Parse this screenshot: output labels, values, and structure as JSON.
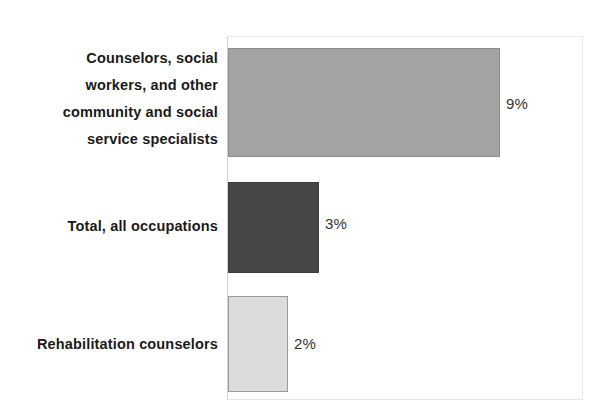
{
  "chart_data": {
    "type": "bar",
    "orientation": "horizontal",
    "title": "",
    "subtitle": "",
    "xlabel": "",
    "ylabel": "",
    "categories": [
      "Counselors, social\nworkers, and other\ncommunity and social\nservice specialists",
      "Total, all occupations",
      "Rehabilitation counselors"
    ],
    "values": [
      9,
      3,
      2
    ],
    "value_labels": [
      "9%",
      "3%",
      "2%"
    ],
    "units": "percent",
    "xlim": [
      0,
      11.8
    ],
    "grid": false,
    "legend": false,
    "bar_colors": [
      "#a3a3a3",
      "#474747",
      "#dcdcdc"
    ],
    "bar_border_colors": [
      "#8d8d8d",
      "#3c3c3c",
      "#9a9a9a"
    ]
  },
  "chart": {
    "background_color": "#ffffff",
    "frame_color": "#e8e8e8",
    "axis_color": "#d2d2d2",
    "label_color": "#1a1a1a",
    "value_color": "#333333"
  }
}
